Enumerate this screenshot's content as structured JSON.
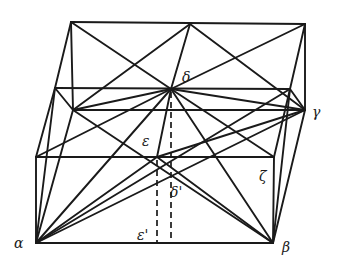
{
  "diagram": {
    "type": "geometric-solid-construction",
    "labels": {
      "alpha": "α",
      "beta": "β",
      "gamma": "γ",
      "delta": "δ",
      "delta_prime": "δ'",
      "epsilon": "ε",
      "epsilon_prime": "ε'",
      "zeta": "ζ"
    },
    "colors": {
      "line": "#1a1a1a",
      "background": "#ffffff"
    }
  }
}
